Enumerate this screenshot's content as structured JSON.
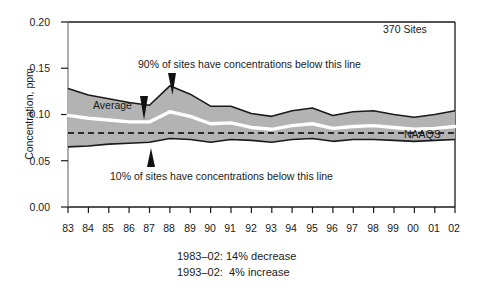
{
  "chart_data": {
    "type": "area",
    "title": "",
    "subtitle": "",
    "xlabel": "",
    "ylabel": "Concentration, ppm",
    "xlim": [
      1983,
      2002
    ],
    "ylim": [
      0.0,
      0.2
    ],
    "grid": false,
    "legend_position": "none",
    "categories": [
      "83",
      "84",
      "85",
      "86",
      "87",
      "88",
      "89",
      "90",
      "91",
      "92",
      "93",
      "94",
      "95",
      "96",
      "97",
      "98",
      "99",
      "00",
      "01",
      "02"
    ],
    "x": [
      1983,
      1984,
      1985,
      1986,
      1987,
      1988,
      1989,
      1990,
      1991,
      1992,
      1993,
      1994,
      1995,
      1996,
      1997,
      1998,
      1999,
      2000,
      2001,
      2002
    ],
    "series": [
      {
        "name": "90th percentile",
        "values": [
          0.128,
          0.121,
          0.117,
          0.113,
          0.11,
          0.131,
          0.122,
          0.109,
          0.109,
          0.101,
          0.098,
          0.104,
          0.107,
          0.099,
          0.103,
          0.104,
          0.1,
          0.097,
          0.1,
          0.104
        ]
      },
      {
        "name": "Average",
        "values": [
          0.099,
          0.096,
          0.094,
          0.092,
          0.092,
          0.103,
          0.098,
          0.09,
          0.091,
          0.086,
          0.084,
          0.088,
          0.09,
          0.085,
          0.087,
          0.088,
          0.086,
          0.084,
          0.085,
          0.087
        ]
      },
      {
        "name": "10th percentile",
        "values": [
          0.065,
          0.066,
          0.068,
          0.069,
          0.07,
          0.074,
          0.073,
          0.07,
          0.073,
          0.072,
          0.07,
          0.073,
          0.074,
          0.071,
          0.073,
          0.073,
          0.072,
          0.071,
          0.072,
          0.073
        ]
      },
      {
        "name": "NAAQS",
        "values": [
          0.08,
          0.08,
          0.08,
          0.08,
          0.08,
          0.08,
          0.08,
          0.08,
          0.08,
          0.08,
          0.08,
          0.08,
          0.08,
          0.08,
          0.08,
          0.08,
          0.08,
          0.08,
          0.08,
          0.08
        ]
      }
    ],
    "ytick_labels": [
      "0.20",
      "0.15",
      "0.10",
      "0.05",
      "0.00"
    ],
    "ytick_values": [
      0.2,
      0.15,
      0.1,
      0.05,
      0.0
    ],
    "annotations": {
      "sites": "370 Sites",
      "upper_band": "90% of sites have concentrations below this line",
      "lower_band": "10% of sites have concentrations below this line",
      "average": "Average",
      "naaqs": "NAAQS"
    },
    "footnotes": [
      "1983–02: 14% decrease",
      "1993–02:  4% increase"
    ],
    "colors": {
      "band_fill": "#b3b3b3",
      "band_edge": "#1a1a1a",
      "average_line": "#ffffff",
      "naaqs_line": "#000000",
      "background": "#ffffff",
      "text": "#1a1a1a"
    }
  }
}
